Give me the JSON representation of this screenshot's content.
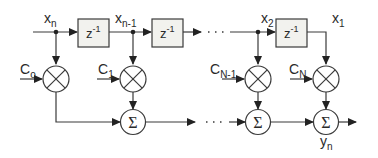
{
  "diagram": {
    "delay_label": "z",
    "delay_exp": "-1",
    "taps": [
      {
        "signal": "x",
        "signal_sub": "n",
        "coef": "C",
        "coef_sub": "o"
      },
      {
        "signal": "x",
        "signal_sub": "n-1",
        "coef": "C",
        "coef_sub": "1"
      },
      {
        "signal": "x",
        "signal_sub": "2",
        "coef": "C",
        "coef_sub": "N-1"
      },
      {
        "signal": "x",
        "signal_sub": "1",
        "coef": "C",
        "coef_sub": "N"
      }
    ],
    "sum_symbol": "Σ",
    "ellipsis": "· · ·",
    "output": {
      "label": "y",
      "sub": "n"
    },
    "colors": {
      "stroke": "#3a3a3a",
      "box_fill": "#f2f2ee",
      "background": "#ffffff"
    }
  }
}
